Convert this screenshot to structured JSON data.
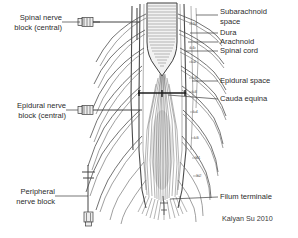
{
  "figure": {
    "credit": "Kalyan Su 2010",
    "ink_color": "#3c3c3c",
    "background_color": "#ffffff"
  },
  "left_labels": [
    {
      "id": "spinal-nerve-block",
      "line1": "Spinal nerve",
      "line2": "block (central)"
    },
    {
      "id": "epidural-nerve-block",
      "line1": "Epidural nerve",
      "line2": "block (central)"
    },
    {
      "id": "peripheral-nerve-block",
      "line1": "Peripheral",
      "line2": "nerve block"
    }
  ],
  "right_labels": [
    {
      "id": "subarachnoid-space",
      "line1": "Subarachnoid",
      "line2": "space"
    },
    {
      "id": "dura",
      "line1": "Dura",
      "line2": ""
    },
    {
      "id": "arachnoid",
      "line1": "Arachnoid",
      "line2": ""
    },
    {
      "id": "spinal-cord",
      "line1": "Spinal cord",
      "line2": ""
    },
    {
      "id": "epidural-space",
      "line1": "Epidural space",
      "line2": ""
    },
    {
      "id": "cauda-equina",
      "line1": "Cauda equina",
      "line2": ""
    },
    {
      "id": "filum-terminale",
      "line1": "Filum terminale",
      "line2": ""
    }
  ],
  "vertebral_levels": [
    {
      "label": "T12",
      "y": 24
    },
    {
      "label": "L1",
      "y": 48
    },
    {
      "label": "L2",
      "y": 62
    },
    {
      "label": "L3",
      "y": 78
    },
    {
      "label": "L3",
      "y": 92
    },
    {
      "label": "L4",
      "y": 112
    },
    {
      "label": "L5",
      "y": 138
    },
    {
      "label": "S1",
      "y": 158
    },
    {
      "label": "S2",
      "y": 176
    }
  ],
  "needles": [
    {
      "id": "spinal-needle",
      "kind": "hub-and-shaft"
    },
    {
      "id": "epidural-needle",
      "kind": "hub-and-shaft"
    },
    {
      "id": "peripheral-needle",
      "kind": "vertical-hub"
    }
  ]
}
